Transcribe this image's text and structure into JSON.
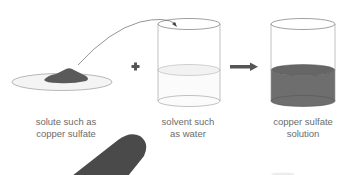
{
  "diagram": {
    "items": [
      {
        "id": "solute",
        "lines": [
          "solute such as",
          "copper sulfate"
        ]
      },
      {
        "id": "solvent",
        "lines": [
          "solvent such",
          "as water"
        ]
      },
      {
        "id": "solution",
        "lines": [
          "copper sulfate",
          "solution"
        ]
      }
    ],
    "operators": {
      "plus": "+",
      "arrow": "→"
    },
    "colors": {
      "solute": "#5a5a5a",
      "solution_liquid": "#6e6e6e",
      "outline": "#8a8a8a",
      "label_text": "#6b6b6b",
      "operator": "#555555"
    }
  }
}
